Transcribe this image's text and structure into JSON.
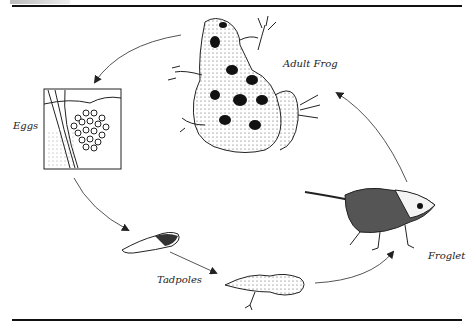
{
  "figure": {
    "title_fragment": "",
    "stages": [
      {
        "id": "eggs",
        "label": "Eggs"
      },
      {
        "id": "tadpoles",
        "label": "Tadpoles"
      },
      {
        "id": "froglet",
        "label": "Froglet"
      },
      {
        "id": "adult",
        "label": "Adult Frog"
      }
    ],
    "cycle_order": [
      "Eggs",
      "Tadpoles",
      "Froglet",
      "Adult Frog"
    ],
    "colors": {
      "ink": "#111111",
      "background": "#ffffff",
      "arrow": "#555555"
    }
  }
}
